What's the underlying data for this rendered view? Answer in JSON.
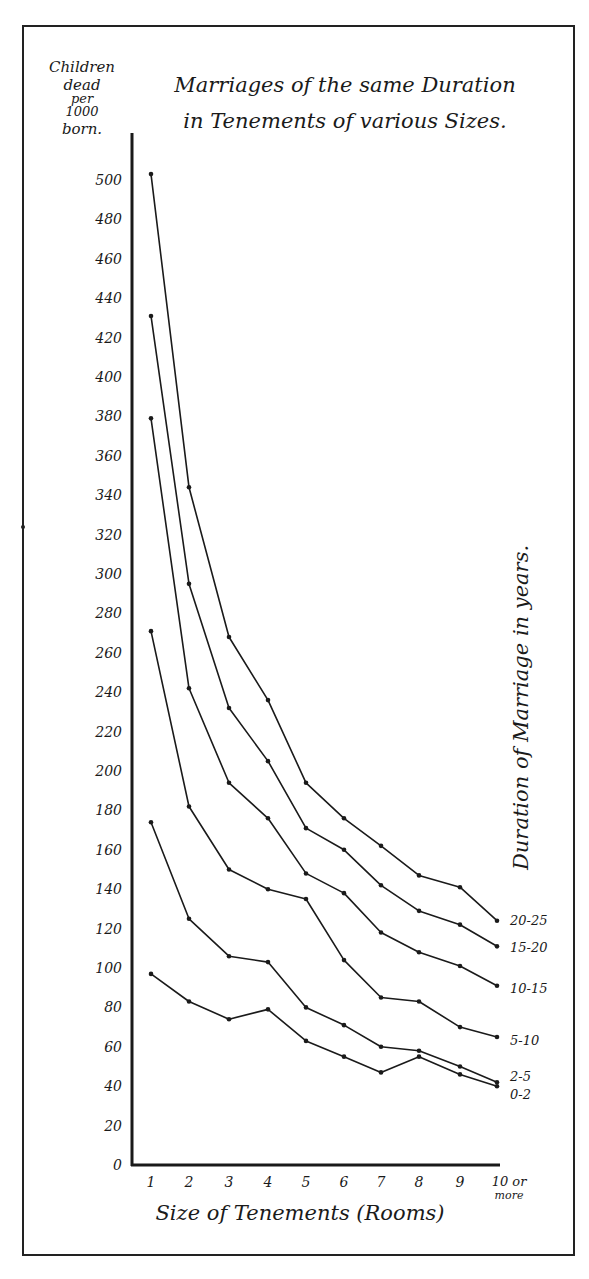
{
  "chart_data": {
    "type": "line",
    "title_lines": [
      "Marriages of the same Duration",
      "in Tenements of various Sizes."
    ],
    "xlabel": "Size of Tenements (Rooms)",
    "ylabel": "Children dead per 1000 born.",
    "ylabel_lines": [
      "Children",
      "dead",
      "per",
      "1000",
      "born."
    ],
    "legend_title": "Duration of Marriage in years.",
    "legend_position": "right, labels at line ends",
    "grid": false,
    "ylim": [
      0,
      510
    ],
    "yticks": [
      0,
      20,
      40,
      60,
      80,
      100,
      120,
      140,
      160,
      180,
      200,
      220,
      240,
      260,
      280,
      300,
      320,
      340,
      360,
      380,
      400,
      420,
      440,
      460,
      480,
      500
    ],
    "categories": [
      "1",
      "2",
      "3",
      "4",
      "5",
      "6",
      "7",
      "8",
      "9",
      "10 or more"
    ],
    "series": [
      {
        "name": "20-25",
        "values": [
          503,
          344,
          268,
          236,
          194,
          176,
          162,
          147,
          141,
          124
        ]
      },
      {
        "name": "15-20",
        "values": [
          431,
          295,
          232,
          205,
          171,
          160,
          142,
          129,
          122,
          111
        ]
      },
      {
        "name": "10-15",
        "values": [
          379,
          242,
          194,
          176,
          148,
          138,
          118,
          108,
          101,
          91
        ]
      },
      {
        "name": "5-10",
        "values": [
          271,
          182,
          150,
          140,
          135,
          104,
          85,
          83,
          70,
          65
        ]
      },
      {
        "name": "2-5",
        "values": [
          174,
          125,
          106,
          103,
          80,
          71,
          60,
          58,
          50,
          42
        ]
      },
      {
        "name": "0-2",
        "values": [
          97,
          83,
          74,
          79,
          63,
          55,
          47,
          55,
          46,
          40
        ]
      }
    ]
  }
}
